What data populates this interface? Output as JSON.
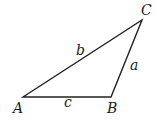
{
  "figure": {
    "type": "triangle",
    "vertices": {
      "A": {
        "label": "A",
        "x": 23,
        "y": 97
      },
      "B": {
        "label": "B",
        "x": 111,
        "y": 97
      },
      "C": {
        "label": "C",
        "x": 142,
        "y": 20
      }
    },
    "sides": {
      "a": {
        "label": "a",
        "between": "B-C"
      },
      "b": {
        "label": "b",
        "between": "A-C"
      },
      "c": {
        "label": "c",
        "between": "A-B"
      }
    },
    "stroke_color": "#222222"
  }
}
